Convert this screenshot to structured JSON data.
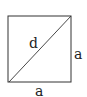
{
  "diagram": {
    "shape": "square",
    "diagonal_label": "d",
    "side_right_label": "a",
    "side_bottom_label": "a",
    "stroke_color": "#333333",
    "background": "#ffffff"
  }
}
